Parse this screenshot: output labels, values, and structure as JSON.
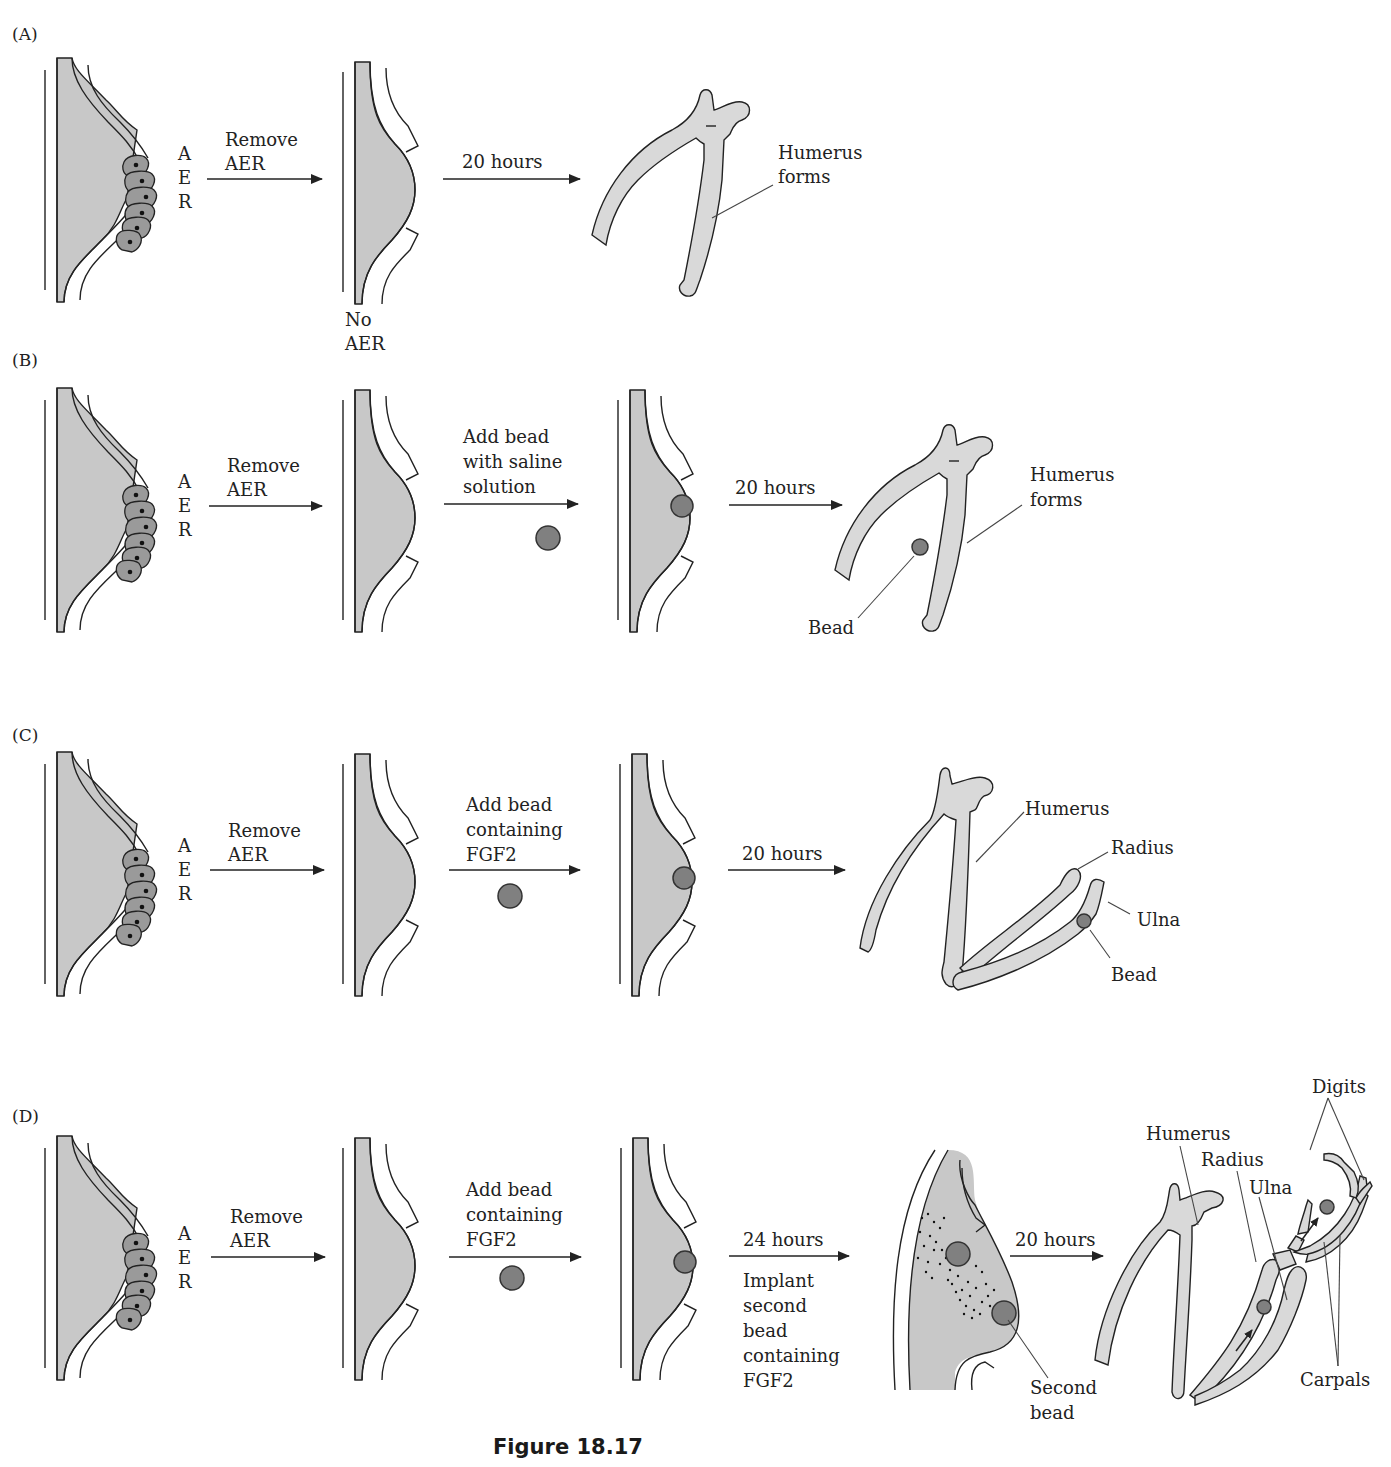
{
  "figure": {
    "caption": "Figure 18.17",
    "colors": {
      "mesenchyme": "#c8c8c8",
      "aer_cells": "#9a9a9a",
      "bead": "#808080",
      "bone": "#d9d9d9",
      "line": "#222222"
    }
  },
  "panels": [
    {
      "id": "A",
      "label": "(A)",
      "aer_letters": [
        "A",
        "E",
        "R"
      ],
      "steps": [
        {
          "arrow_label": [
            "Remove",
            "AER"
          ]
        },
        {
          "arrow_label": [
            "20 hours"
          ]
        }
      ],
      "bud_note": [
        "No",
        "AER"
      ],
      "result_labels": [
        "Humerus",
        "forms"
      ]
    },
    {
      "id": "B",
      "label": "(B)",
      "aer_letters": [
        "A",
        "E",
        "R"
      ],
      "steps": [
        {
          "arrow_label": [
            "Remove",
            "AER"
          ]
        },
        {
          "arrow_label": [
            "Add bead",
            "with saline",
            "solution"
          ]
        },
        {
          "arrow_label": [
            "20 hours"
          ]
        }
      ],
      "result_labels": {
        "humerus": [
          "Humerus",
          "forms"
        ],
        "bead": "Bead"
      }
    },
    {
      "id": "C",
      "label": "(C)",
      "aer_letters": [
        "A",
        "E",
        "R"
      ],
      "steps": [
        {
          "arrow_label": [
            "Remove",
            "AER"
          ]
        },
        {
          "arrow_label": [
            "Add bead",
            "containing",
            "FGF2"
          ]
        },
        {
          "arrow_label": [
            "20 hours"
          ]
        }
      ],
      "result_labels": {
        "humerus": "Humerus",
        "radius": "Radius",
        "ulna": "Ulna",
        "bead": "Bead"
      }
    },
    {
      "id": "D",
      "label": "(D)",
      "aer_letters": [
        "A",
        "E",
        "R"
      ],
      "steps": [
        {
          "arrow_label": [
            "Remove",
            "AER"
          ]
        },
        {
          "arrow_label": [
            "Add bead",
            "containing",
            "FGF2"
          ]
        },
        {
          "arrow_label": [
            "24 hours"
          ],
          "sub_label": [
            "Implant",
            "second",
            "bead",
            "containing",
            "FGF2"
          ]
        },
        {
          "arrow_label": [
            "20 hours"
          ]
        }
      ],
      "intermediate_labels": [
        "Second",
        "bead"
      ],
      "result_labels": {
        "humerus": "Humerus",
        "radius": "Radius",
        "ulna": "Ulna",
        "digits": "Digits",
        "carpals": "Carpals"
      }
    }
  ]
}
